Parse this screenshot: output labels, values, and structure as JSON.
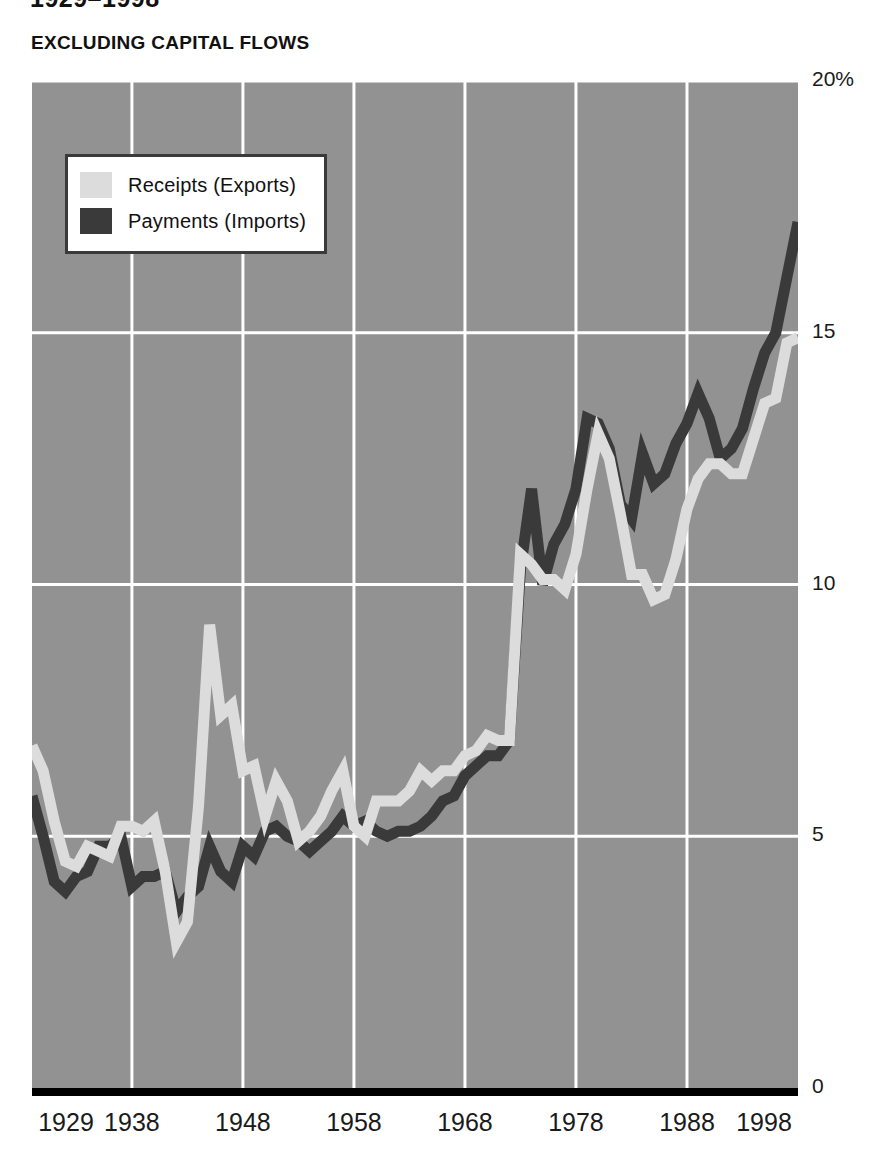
{
  "header": {
    "title": "1929–1998",
    "subtitle": "EXCLUDING CAPITAL FLOWS"
  },
  "legend": {
    "position": "inside-top-left",
    "items": [
      {
        "label": "Receipts (Exports)",
        "color": "#dcdcdc",
        "name": "receipts"
      },
      {
        "label": "Payments (Imports)",
        "color": "#3a3a3a",
        "name": "payments"
      }
    ]
  },
  "axes": {
    "y_ticks": [
      "20%",
      "15",
      "10",
      "5",
      "0"
    ],
    "y_values": [
      20,
      15,
      10,
      5,
      0
    ],
    "x_ticks": [
      "1929",
      "1938",
      "1948",
      "1958",
      "1968",
      "1978",
      "1988",
      "1998"
    ],
    "x_values": [
      1929,
      1938,
      1948,
      1958,
      1968,
      1978,
      1988,
      1998
    ]
  },
  "style": {
    "plot_background": "#929292",
    "gridline_color": "#ffffff",
    "baseline_color": "#000000",
    "page_background": "#ffffff",
    "text_color": "#1a1a1a"
  },
  "chart_data": {
    "type": "line",
    "title": "1929–1998",
    "subtitle": "EXCLUDING CAPITAL FLOWS",
    "xlabel": "",
    "ylabel": "Percent of GDP",
    "xlim": [
      1929,
      1998
    ],
    "ylim": [
      0,
      20
    ],
    "grid": true,
    "legend_position": "inside-top-left",
    "x": [
      1929,
      1930,
      1931,
      1932,
      1933,
      1934,
      1935,
      1936,
      1937,
      1938,
      1939,
      1940,
      1941,
      1942,
      1943,
      1944,
      1945,
      1946,
      1947,
      1948,
      1949,
      1950,
      1951,
      1952,
      1953,
      1954,
      1955,
      1956,
      1957,
      1958,
      1959,
      1960,
      1961,
      1962,
      1963,
      1964,
      1965,
      1966,
      1967,
      1968,
      1969,
      1970,
      1971,
      1972,
      1973,
      1974,
      1975,
      1976,
      1977,
      1978,
      1979,
      1980,
      1981,
      1982,
      1983,
      1984,
      1985,
      1986,
      1987,
      1988,
      1989,
      1990,
      1991,
      1992,
      1993,
      1994,
      1995,
      1996,
      1997,
      1998
    ],
    "series": [
      {
        "name": "Receipts (Exports)",
        "color": "#dcdcdc",
        "values": [
          6.8,
          6.3,
          5.3,
          4.5,
          4.4,
          4.8,
          4.7,
          4.6,
          5.2,
          5.2,
          5.1,
          5.3,
          4.3,
          2.9,
          3.3,
          5.6,
          9.2,
          7.4,
          7.6,
          6.3,
          6.4,
          5.4,
          6.1,
          5.7,
          4.9,
          5.1,
          5.4,
          5.9,
          6.3,
          5.2,
          5.0,
          5.7,
          5.7,
          5.7,
          5.9,
          6.3,
          6.1,
          6.3,
          6.3,
          6.6,
          6.7,
          7.0,
          6.9,
          6.9,
          10.6,
          10.4,
          10.1,
          10.1,
          9.9,
          10.6,
          11.9,
          13.0,
          12.5,
          11.4,
          10.2,
          10.2,
          9.7,
          9.8,
          10.5,
          11.5,
          12.1,
          12.4,
          12.4,
          12.2,
          12.2,
          12.9,
          13.6,
          13.7,
          14.8,
          14.9
        ]
      },
      {
        "name": "Payments (Imports)",
        "color": "#3a3a3a",
        "values": [
          5.8,
          5.0,
          4.1,
          3.9,
          4.2,
          4.3,
          4.8,
          4.8,
          5.0,
          4.0,
          4.2,
          4.2,
          4.3,
          3.5,
          3.8,
          4.0,
          4.8,
          4.3,
          4.1,
          4.8,
          4.6,
          5.1,
          5.2,
          5.0,
          4.9,
          4.7,
          4.9,
          5.1,
          5.4,
          5.2,
          5.3,
          5.1,
          5.0,
          5.1,
          5.1,
          5.2,
          5.4,
          5.7,
          5.8,
          6.2,
          6.4,
          6.6,
          6.6,
          6.9,
          10.3,
          11.9,
          10.0,
          10.8,
          11.2,
          11.9,
          13.3,
          13.2,
          12.7,
          11.6,
          11.3,
          12.6,
          12.0,
          12.2,
          12.8,
          13.2,
          13.8,
          13.3,
          12.5,
          12.7,
          13.1,
          13.9,
          14.6,
          15.0,
          16.1,
          17.2
        ]
      }
    ]
  }
}
